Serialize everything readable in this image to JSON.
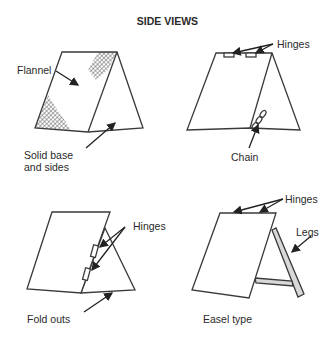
{
  "figure": {
    "title": "SIDE VIEWS",
    "panels": [
      {
        "id": "flannel-board",
        "labels": [
          "Flannel",
          "Solid base and sides"
        ]
      },
      {
        "id": "hinged-chain-board",
        "labels": [
          "Hinges",
          "Chain"
        ]
      },
      {
        "id": "fold-out-board",
        "labels": [
          "Hinges",
          "Fold outs"
        ]
      },
      {
        "id": "easel-board",
        "labels": [
          "Hinges",
          "Legs",
          "Easel type"
        ]
      }
    ]
  },
  "labels": {
    "flannel": "Flannel",
    "solid_base_1": "Solid base",
    "solid_base_2": "and sides",
    "hinges_top_right": "Hinges",
    "chain": "Chain",
    "hinges_bottom_left": "Hinges",
    "fold_outs": "Fold outs",
    "hinges_bottom_right": "Hinges",
    "legs": "Legs",
    "easel_type": "Easel type"
  },
  "colors": {
    "line": "#3a3a3a",
    "hatch": "#555555",
    "leg": "#9a9a9a"
  }
}
